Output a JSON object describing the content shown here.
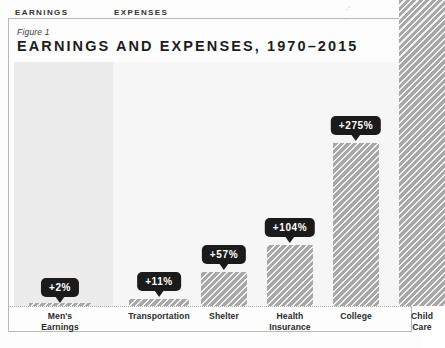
{
  "figure": {
    "label": "Figure 1",
    "title": "EARNINGS AND EXPENSES, 1970–2015"
  },
  "sections": {
    "earnings_label": "EARNINGS",
    "expenses_label": "EXPENSES"
  },
  "colors": {
    "bar_fill": "#a8a8a8",
    "badge_bg": "#1b1b1b",
    "badge_text": "#ffffff",
    "earnings_band": "#ececec",
    "expenses_band": "#f6f6f6",
    "frame_border": "#b9b9b9",
    "title_text": "#1d1d1d"
  },
  "chart_data": {
    "type": "bar",
    "title": "EARNINGS AND EXPENSES, 1970–2015",
    "subtitle": "Figure 1",
    "xlabel": "",
    "ylabel": "",
    "grid": false,
    "legend": "none",
    "ylim": [
      0,
      300
    ],
    "categories": [
      "Men's Earnings",
      "Transportation",
      "Shelter",
      "Health Insurance",
      "College",
      "Child Care"
    ],
    "values": [
      2,
      11,
      57,
      104,
      275,
      320
    ],
    "value_labels": [
      "+2%",
      "+11%",
      "+57%",
      "+104%",
      "+275%",
      ""
    ],
    "groups": [
      "EARNINGS",
      "EXPENSES",
      "EXPENSES",
      "EXPENSES",
      "EXPENSES",
      "EXPENSES"
    ]
  },
  "bars": [
    {
      "name": "mens-earnings",
      "label": "Men's\nEarnings",
      "badge": "+2%",
      "cx": 60,
      "w": 62,
      "top": 303,
      "badge_top": 278,
      "has_badge": true,
      "overflow": false
    },
    {
      "name": "transportation",
      "label": "Transportation",
      "badge": "+11%",
      "cx": 159,
      "w": 60,
      "top": 299,
      "badge_top": 272,
      "has_badge": true,
      "overflow": false
    },
    {
      "name": "shelter",
      "label": "Shelter",
      "badge": "+57%",
      "cx": 224,
      "w": 46,
      "top": 272,
      "badge_top": 245,
      "has_badge": true,
      "overflow": false
    },
    {
      "name": "health-insurance",
      "label": "Health\nInsurance",
      "badge": "+104%",
      "cx": 290,
      "w": 46,
      "top": 245,
      "badge_top": 218,
      "has_badge": true,
      "overflow": false
    },
    {
      "name": "college",
      "label": "College",
      "badge": "+275%",
      "cx": 356,
      "w": 46,
      "top": 143,
      "badge_top": 116,
      "has_badge": true,
      "overflow": false
    },
    {
      "name": "child-care",
      "label": "Child Care",
      "badge": "",
      "cx": 422,
      "w": 46,
      "top": 0,
      "badge_top": 0,
      "has_badge": false,
      "overflow": true
    }
  ]
}
